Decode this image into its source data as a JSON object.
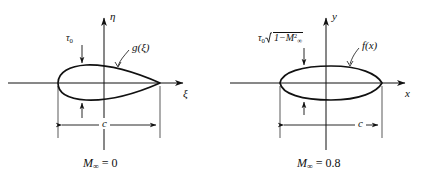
{
  "figure": {
    "background_color": "#ffffff",
    "line_color": "#111111"
  },
  "panels": [
    {
      "id": "incompressible",
      "caption_symbol": "M",
      "caption_subscript": "∞",
      "caption_value": "= 0",
      "caption_full": "M∞ = 0",
      "vertical_axis_label": "η",
      "horizontal_axis_label": "ξ",
      "shape_kind": "airfoil-teardrop",
      "curve_label": "g(ξ)",
      "thickness_label_tau": "τ",
      "thickness_label_sub": "0",
      "thickness_label_full": "τ0",
      "chord_label": "c",
      "arrow_up_label": "thickness-arrow-upper",
      "arrow_down_label": "thickness-arrow-lower"
    },
    {
      "id": "compressible",
      "caption_symbol": "M",
      "caption_subscript": "∞",
      "caption_value": "= 0.8",
      "caption_full": "M∞ = 0.8",
      "vertical_axis_label": "y",
      "horizontal_axis_label": "x",
      "shape_kind": "thin-ellipse",
      "curve_label": "f(x)",
      "thickness_label_tau": "τ",
      "thickness_label_sub": "0",
      "thickness_radical_inner_pre": "1−",
      "thickness_radical_inner_sym": "M",
      "thickness_radical_inner_sub": "∞",
      "thickness_radical_inner_sup": "2",
      "thickness_label_full": "τ0√(1−M∞²)",
      "chord_label": "c",
      "arrow_up_label": "thickness-arrow-upper",
      "arrow_down_label": "thickness-arrow-lower"
    }
  ],
  "geometry": {
    "axis_y": 83,
    "axis_x_start": 8,
    "axis_x_end": 188,
    "vertical_axis_x": 104,
    "vertical_axis_top": 14,
    "vertical_axis_bottom": 150,
    "chord_line_y": 125,
    "leading_edge_x": 58,
    "trailing_edge_x": 160
  }
}
